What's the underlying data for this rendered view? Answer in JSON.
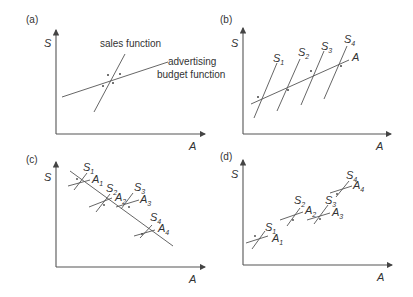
{
  "panels": [
    {
      "id": "a",
      "label": "(a)",
      "y_axis": "S",
      "x_axis": "A",
      "annotations": [
        "sales function",
        "advertising",
        "budget function"
      ]
    },
    {
      "id": "b",
      "label": "(b)",
      "y_axis": "S",
      "x_axis": "A",
      "line_labels": [
        "S",
        "S",
        "S",
        "S",
        "A"
      ],
      "subscripts": [
        "1",
        "2",
        "3",
        "4"
      ]
    },
    {
      "id": "c",
      "label": "(c)",
      "y_axis": "S",
      "x_axis": "A",
      "pairs": [
        {
          "s": "S",
          "a": "A",
          "n": "1"
        },
        {
          "s": "S",
          "a": "A",
          "n": "2"
        },
        {
          "s": "S",
          "a": "A",
          "n": "3"
        },
        {
          "s": "S",
          "a": "A",
          "n": "4"
        }
      ]
    },
    {
      "id": "d",
      "label": "(d)",
      "y_axis": "S",
      "x_axis": "A",
      "pairs": [
        {
          "s": "S",
          "a": "A",
          "n": "1"
        },
        {
          "s": "S",
          "a": "A",
          "n": "2"
        },
        {
          "s": "S",
          "a": "A",
          "n": "3"
        },
        {
          "s": "S",
          "a": "A",
          "n": "4"
        }
      ]
    }
  ]
}
